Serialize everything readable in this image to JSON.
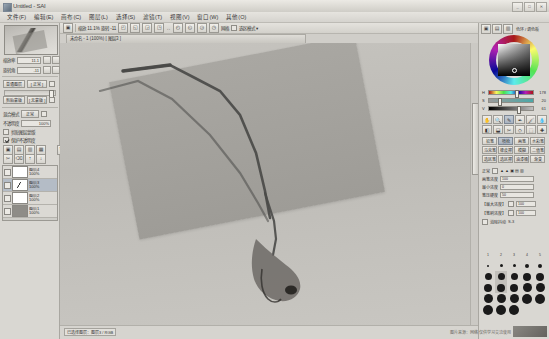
{
  "window": {
    "title": "Untitled - SAI",
    "buttons": [
      "_",
      "□",
      "✕"
    ]
  },
  "menu": {
    "items": [
      {
        "label": "文件(F)"
      },
      {
        "label": "编辑(E)"
      },
      {
        "label": "画布(C)"
      },
      {
        "label": "图层(L)"
      },
      {
        "label": "选择(S)"
      },
      {
        "label": "滤镜(T)"
      },
      {
        "label": "视图(V)"
      },
      {
        "label": "窗口(W)"
      },
      {
        "label": "其他(O)"
      }
    ]
  },
  "sidebar": {
    "navigator": {
      "label": "导航器"
    },
    "zoom": {
      "label": "缩放率",
      "value": "11.1"
    },
    "rotate": {
      "label": "旋转角",
      "value": "-11"
    },
    "view_buttons": [
      "+",
      "-",
      "▣",
      "↻",
      "↺",
      "◳"
    ],
    "layer_section": {
      "mode_label": "普通图层",
      "mode_value": "[ 正常 ]",
      "clip_label": "剪贴蒙版",
      "clip_value": "[ 无蒙版 ]",
      "blend_label": "混合模式",
      "blend_value": "正常",
      "opacity_label": "不透明度",
      "opacity_value": "100%",
      "check_clip": "剪贴图层蒙版",
      "check_lock": "保护不透明度"
    },
    "layer_toolbar": [
      "▣",
      "▤",
      "▥",
      "▦",
      "✂",
      "⌫",
      "↑",
      "↓",
      "🗑"
    ],
    "layers": [
      {
        "name": "图层4",
        "opacity": "100%",
        "selected": false,
        "thumb": "light"
      },
      {
        "name": "图层3",
        "opacity": "100%",
        "selected": true,
        "thumb": "stroke"
      },
      {
        "name": "图层2",
        "opacity": "100%",
        "selected": false,
        "thumb": "light"
      },
      {
        "name": "图层1",
        "opacity": "100%",
        "selected": false,
        "thumb": "dark"
      }
    ]
  },
  "canvas": {
    "toolbar": {
      "left_icons": [
        "▣",
        "▤"
      ],
      "nav_text": "缩放 11.1%   旋转 -11",
      "group_a": [
        "◰",
        "◱",
        "◲",
        "◳"
      ],
      "mirror_text": "↔",
      "group_b": [
        "◴",
        "◵",
        "◶",
        "◷"
      ],
      "grid_text": "网格",
      "grid_check": "□",
      "selection_text": "选区模式 ▾"
    },
    "document_tab": "未命名 - 1  (100%)  [ 图层3 ]",
    "status_chip": "已选择图层：图层3  /  RGB",
    "bottom_note": "缩放率 11.1%  旋转角 -11.0°  坐标 --,--"
  },
  "right": {
    "tabs": [
      "▣",
      "▤",
      "▥"
    ],
    "tabs_label": "色环 / 调色板",
    "hsv": [
      {
        "label": "H",
        "value": "178",
        "knob": 58
      },
      {
        "label": "S",
        "value": "20",
        "knob": 20
      },
      {
        "label": "V",
        "value": "61",
        "knob": 61
      }
    ],
    "tools": [
      "✋",
      "🔍",
      "✎",
      "✒",
      "🖌",
      "💧",
      "◧",
      "⬓",
      "✂",
      "◇",
      "⬚",
      "✚"
    ],
    "brush_presets": [
      {
        "label": "铅笔",
        "selected": false
      },
      {
        "label": "喷枪",
        "selected": true
      },
      {
        "label": "画笔",
        "selected": false
      },
      {
        "label": "水彩笔",
        "selected": false
      },
      {
        "label": "马克笔",
        "selected": false
      },
      {
        "label": "橡皮擦",
        "selected": false
      },
      {
        "label": "模糊",
        "selected": false
      },
      {
        "label": "二值笔",
        "selected": false
      },
      {
        "label": "选区笔",
        "selected": false
      },
      {
        "label": "选区擦",
        "selected": false
      },
      {
        "label": "油漆桶",
        "selected": false
      },
      {
        "label": "渐变",
        "selected": false
      }
    ],
    "brush_params": [
      {
        "label": "正常",
        "value": "▲ ▲ ▣ ▤ ▥"
      },
      {
        "label": "画笔浓度",
        "value": "100"
      },
      {
        "label": "最小浓度",
        "value": "0"
      },
      {
        "label": "笔压硬度",
        "value": "50"
      },
      {
        "label": "【最大浓度】",
        "value": "100"
      },
      {
        "label": "【笔刷浓度】",
        "value": "100"
      },
      {
        "label": "消除抖动",
        "value": "S-3"
      }
    ],
    "size_label_row": [
      "1",
      "2",
      "3",
      "4",
      "5"
    ],
    "size_rows": [
      [
        2,
        2.5,
        3,
        3.5,
        4
      ],
      [
        4.5,
        5,
        5.5,
        6,
        6.5
      ],
      [
        7,
        7.5,
        8,
        8.5,
        9
      ],
      [
        9,
        9.5,
        9.5,
        10,
        10
      ],
      [
        10,
        10,
        10,
        0,
        0
      ]
    ],
    "size_selected": {
      "row": 2,
      "col": 1
    }
  },
  "watermark": {
    "text": "图片来源：网络  仅供学习交流使用"
  }
}
